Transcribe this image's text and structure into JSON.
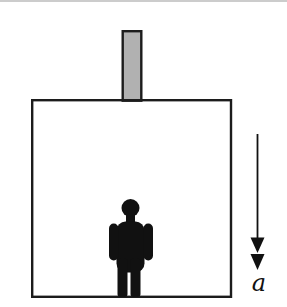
{
  "diagram": {
    "acceleration_label": "a",
    "shapes": {
      "rod": "piston-rod",
      "box": "elevator-box",
      "person": "person-figure",
      "arrow": "downward-acceleration-arrow"
    },
    "colors": {
      "background": "#ffffff",
      "outline": "#1c1c1c",
      "rod_fill": "#b1b1b1",
      "person_fill": "#111111",
      "arrow": "#111111",
      "top_rule": "#cccccc"
    }
  }
}
